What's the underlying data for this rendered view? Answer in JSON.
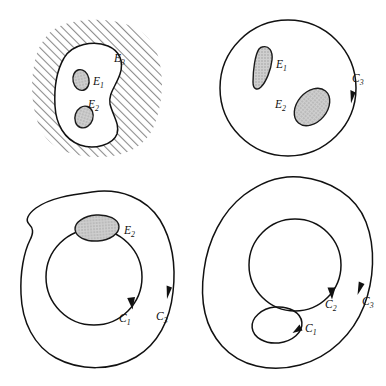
{
  "figure": {
    "background_color": "#ffffff",
    "stroke_color": "#111111",
    "blob_fill_color": "#c6c6c6",
    "hatch_color": "#7d7d7d",
    "width": 386,
    "height": 386
  },
  "panels": [
    {
      "id": "top-left",
      "name": "hatched-region-panel",
      "description": "Hatched exterior region with white bean-shaped interior containing two small blobs",
      "labels": [
        {
          "id": "e3",
          "base": "E",
          "sub": "3",
          "x": 117,
          "y": 61
        },
        {
          "id": "e1",
          "base": "E",
          "sub": "1",
          "x": 92,
          "y": 84
        },
        {
          "id": "e2",
          "base": "E",
          "sub": "2",
          "x": 88,
          "y": 110
        }
      ],
      "blobs": [
        {
          "id": "e1-blob",
          "name": "blob-e1"
        },
        {
          "id": "e2-blob",
          "name": "blob-e2"
        }
      ]
    },
    {
      "id": "top-right",
      "name": "circle-contour-panel",
      "description": "Circle contour C3 with counterclockwise arrow containing blobs E1 and E2",
      "labels": [
        {
          "id": "e1",
          "base": "E",
          "sub": "1",
          "x": 276,
          "y": 66
        },
        {
          "id": "e2",
          "base": "E",
          "sub": "2",
          "x": 281,
          "y": 105
        },
        {
          "id": "c3",
          "base": "C",
          "sub": "3",
          "x": 352,
          "y": 80
        }
      ],
      "contours": [
        {
          "id": "c3",
          "name": "contour-c3",
          "orientation": "counterclockwise"
        }
      ]
    },
    {
      "id": "bottom-left",
      "name": "annulus-contour-panel",
      "description": "Outer irregular contour C3 counterclockwise, inner circle C1 clockwise, blob E2 between them",
      "labels": [
        {
          "id": "e2",
          "base": "E",
          "sub": "2",
          "x": 124,
          "y": 232
        },
        {
          "id": "c1",
          "base": "C",
          "sub": "1",
          "x": 117,
          "y": 320
        },
        {
          "id": "c3",
          "base": "C",
          "sub": "3",
          "x": 156,
          "y": 320
        }
      ],
      "contours": [
        {
          "id": "c3",
          "name": "contour-c3",
          "orientation": "counterclockwise"
        },
        {
          "id": "c1",
          "name": "contour-c1",
          "orientation": "clockwise"
        }
      ]
    },
    {
      "id": "bottom-right",
      "name": "three-contour-panel",
      "description": "Outer egg contour C3 counterclockwise, inner circle C2 clockwise, small oval C1 clockwise",
      "labels": [
        {
          "id": "c2",
          "base": "C",
          "sub": "2",
          "x": 330,
          "y": 306
        },
        {
          "id": "c3",
          "base": "C",
          "sub": "3",
          "x": 365,
          "y": 303
        },
        {
          "id": "c1",
          "base": "C",
          "sub": "1",
          "x": 305,
          "y": 330
        }
      ],
      "contours": [
        {
          "id": "c3",
          "name": "contour-c3",
          "orientation": "counterclockwise"
        },
        {
          "id": "c2",
          "name": "contour-c2",
          "orientation": "clockwise"
        },
        {
          "id": "c1",
          "name": "contour-c1",
          "orientation": "clockwise"
        }
      ]
    }
  ]
}
